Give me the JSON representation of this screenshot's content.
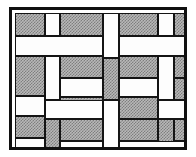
{
  "figure": {
    "frame": {
      "x": 9,
      "y": 7,
      "width": 178,
      "height": 143,
      "border_width": 3,
      "border_color": "#101010",
      "background_color": "#ffffff"
    },
    "style": {
      "tile_border_color": "#141414",
      "tile_border_width": 1.6,
      "shaded_fill_color": "#b8b8b8",
      "shaded_dot_color": "#7e7e7e",
      "plain_fill_color": "#fdfdfd",
      "page_background": "#ffffff"
    },
    "legend": {
      "shaded_label": "shaded tile",
      "plain_label": "plain tile"
    },
    "counts": {
      "shaded_tiles": 36,
      "plain_tiles": 32,
      "total_tiles": 68
    }
  },
  "tiles": [
    {
      "id": "t01",
      "fill": "filled",
      "orient": "h",
      "x": 3,
      "y": 3,
      "w": 30,
      "h": 23
    },
    {
      "id": "t02",
      "fill": "plain",
      "orient": "v",
      "x": 33,
      "y": 3,
      "w": 15,
      "h": 23
    },
    {
      "id": "t03",
      "fill": "filled",
      "orient": "h",
      "x": 48,
      "y": 3,
      "w": 43,
      "h": 23
    },
    {
      "id": "t04",
      "fill": "plain",
      "orient": "v",
      "x": 91,
      "y": 3,
      "w": 16,
      "h": 45
    },
    {
      "id": "t05",
      "fill": "filled",
      "orient": "h",
      "x": 107,
      "y": 3,
      "w": 39,
      "h": 23
    },
    {
      "id": "t06",
      "fill": "plain",
      "orient": "v",
      "x": 146,
      "y": 3,
      "w": 16,
      "h": 23
    },
    {
      "id": "t07",
      "fill": "filled",
      "orient": "h",
      "x": 162,
      "y": 3,
      "w": 36,
      "h": 23
    },
    {
      "id": "t08",
      "fill": "plain",
      "orient": "h",
      "x": 3,
      "y": 26,
      "w": 88,
      "h": 20
    },
    {
      "id": "t09",
      "fill": "plain",
      "orient": "h",
      "x": 107,
      "y": 26,
      "w": 91,
      "h": 20
    },
    {
      "id": "t10",
      "fill": "filled",
      "orient": "v",
      "x": 3,
      "y": 46,
      "w": 30,
      "h": 40
    },
    {
      "id": "t11",
      "fill": "plain",
      "orient": "v",
      "x": 33,
      "y": 46,
      "w": 15,
      "h": 44
    },
    {
      "id": "t12",
      "fill": "filled",
      "orient": "h",
      "x": 48,
      "y": 46,
      "w": 43,
      "h": 22
    },
    {
      "id": "t13",
      "fill": "filled",
      "orient": "v",
      "x": 91,
      "y": 48,
      "w": 16,
      "h": 42
    },
    {
      "id": "t14",
      "fill": "filled",
      "orient": "h",
      "x": 107,
      "y": 46,
      "w": 39,
      "h": 22
    },
    {
      "id": "t15",
      "fill": "plain",
      "orient": "v",
      "x": 146,
      "y": 46,
      "w": 16,
      "h": 44
    },
    {
      "id": "t16",
      "fill": "filled",
      "orient": "h",
      "x": 162,
      "y": 46,
      "w": 36,
      "h": 22
    },
    {
      "id": "t17",
      "fill": "plain",
      "orient": "h",
      "x": 48,
      "y": 68,
      "w": 43,
      "h": 19
    },
    {
      "id": "t18",
      "fill": "plain",
      "orient": "h",
      "x": 107,
      "y": 68,
      "w": 39,
      "h": 19
    },
    {
      "id": "t19",
      "fill": "filled",
      "orient": "h",
      "x": 48,
      "y": 87,
      "w": 43,
      "h": 22
    },
    {
      "id": "t20",
      "fill": "filled",
      "orient": "h",
      "x": 107,
      "y": 87,
      "w": 39,
      "h": 22
    },
    {
      "id": "t21",
      "fill": "filled",
      "orient": "v",
      "x": 162,
      "y": 68,
      "w": 36,
      "h": 22
    },
    {
      "id": "t22",
      "fill": "plain",
      "orient": "h",
      "x": 3,
      "y": 86,
      "w": 30,
      "h": 20
    },
    {
      "id": "t23",
      "fill": "filled",
      "orient": "v",
      "x": 3,
      "y": 106,
      "w": 30,
      "h": 22
    },
    {
      "id": "t24",
      "fill": "plain",
      "orient": "h",
      "x": 33,
      "y": 90,
      "w": 58,
      "h": 19
    },
    {
      "id": "t25",
      "fill": "plain",
      "orient": "h",
      "x": 146,
      "y": 90,
      "w": 52,
      "h": 19
    },
    {
      "id": "t26",
      "fill": "filled",
      "orient": "v",
      "x": 33,
      "y": 109,
      "w": 15,
      "h": 31
    },
    {
      "id": "t27",
      "fill": "filled",
      "orient": "h",
      "x": 48,
      "y": 109,
      "w": 43,
      "h": 22
    },
    {
      "id": "t28",
      "fill": "plain",
      "orient": "v",
      "x": 91,
      "y": 90,
      "w": 16,
      "h": 50
    },
    {
      "id": "t29",
      "fill": "filled",
      "orient": "h",
      "x": 107,
      "y": 109,
      "w": 39,
      "h": 22
    },
    {
      "id": "t30",
      "fill": "filled",
      "orient": "v",
      "x": 146,
      "y": 109,
      "w": 16,
      "h": 31
    },
    {
      "id": "t31",
      "fill": "filled",
      "orient": "h",
      "x": 162,
      "y": 109,
      "w": 36,
      "h": 22
    },
    {
      "id": "t32",
      "fill": "plain",
      "orient": "h",
      "x": 3,
      "y": 128,
      "w": 30,
      "h": 12
    },
    {
      "id": "t33",
      "fill": "plain",
      "orient": "h",
      "x": 48,
      "y": 131,
      "w": 43,
      "h": 9
    },
    {
      "id": "t34",
      "fill": "plain",
      "orient": "h",
      "x": 107,
      "y": 131,
      "w": 91,
      "h": 9
    }
  ]
}
